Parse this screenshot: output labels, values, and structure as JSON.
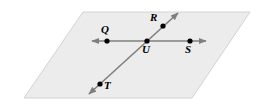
{
  "figure": {
    "type": "geometry-diagram",
    "canvas": {
      "width": 267,
      "height": 106
    },
    "colors": {
      "background": "#ffffff",
      "plane_fill": "#ececec",
      "plane_stroke": "#d2d2d2",
      "line_stroke": "#7f7f7f",
      "point_fill": "#000000",
      "label_color": "#000000"
    },
    "plane": {
      "name": "plane",
      "corners": [
        {
          "x": 83,
          "y": 12
        },
        {
          "x": 250,
          "y": 12
        },
        {
          "x": 192,
          "y": 98
        },
        {
          "x": 24,
          "y": 98
        }
      ]
    },
    "lines": [
      {
        "name": "line-QS",
        "label": "QS",
        "start": {
          "x": 92,
          "y": 41
        },
        "end": {
          "x": 206,
          "y": 41
        },
        "arrow_start": true,
        "arrow_end": true
      },
      {
        "name": "line-RT",
        "label": "RT",
        "start": {
          "x": 178,
          "y": 13
        },
        "end": {
          "x": 89,
          "y": 94
        },
        "arrow_start": true,
        "arrow_end": true
      }
    ],
    "points": [
      {
        "id": "Q",
        "label": "Q",
        "x": 107,
        "y": 41,
        "label_x": 101,
        "label_y": 24
      },
      {
        "id": "R",
        "label": "R",
        "x": 163,
        "y": 26,
        "label_x": 150,
        "label_y": 12
      },
      {
        "id": "U",
        "label": "U",
        "x": 147,
        "y": 41,
        "label_x": 142,
        "label_y": 44
      },
      {
        "id": "S",
        "label": "S",
        "x": 190,
        "y": 41,
        "label_x": 185,
        "label_y": 44
      },
      {
        "id": "T",
        "label": "T",
        "x": 100,
        "y": 84,
        "label_x": 104,
        "label_y": 80
      }
    ]
  }
}
